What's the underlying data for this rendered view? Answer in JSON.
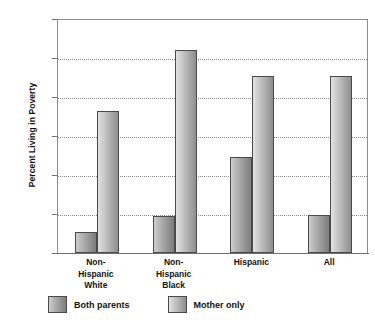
{
  "chart_data": {
    "type": "bar",
    "title": "",
    "subtitle": "",
    "xlabel": "",
    "ylabel": "Percent Living in Poverty",
    "ylim": [
      0,
      60
    ],
    "ytick_values": [
      0,
      10,
      20,
      30,
      40,
      50,
      60
    ],
    "ytick_labels": [
      "0",
      "10",
      "20",
      "30",
      "40",
      "50",
      "60"
    ],
    "grid": "horizontal-dotted",
    "legend_position": "bottom-left",
    "categories": [
      "Non-\nHispanic\nWhite",
      "Non-\nHispanic\nBlack",
      "Hispanic",
      "All"
    ],
    "category_lines": [
      [
        "Non-",
        "Hispanic",
        "White"
      ],
      [
        "Non-",
        "Hispanic",
        "Black"
      ],
      [
        "Hispanic"
      ],
      [
        "All"
      ]
    ],
    "series": [
      {
        "name": "Both parents",
        "color": "#9a9a9a",
        "values": [
          5.5,
          9.5,
          24.5,
          9.8
        ]
      },
      {
        "name": "Mother only",
        "color": "#c0c0c0",
        "values": [
          36.5,
          52.0,
          45.5,
          45.5
        ]
      }
    ]
  },
  "colors": {
    "axis": "#6f6f6f",
    "grid": "#8a8a8a",
    "bar_outline": "#4a4a4a",
    "text": "#111111",
    "background": "#ffffff"
  }
}
